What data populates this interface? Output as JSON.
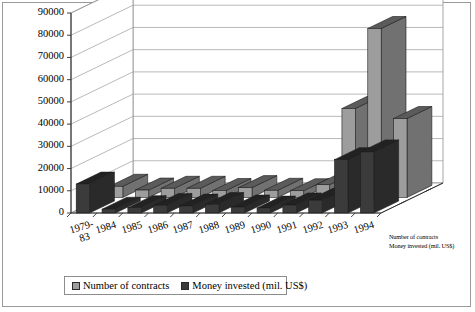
{
  "chart_data": {
    "type": "bar",
    "title": "",
    "subtitle": "",
    "xlabel": "",
    "ylabel": "",
    "projection": "3d-two-row",
    "grid": true,
    "legend_position": "bottom",
    "ylim": [
      0,
      90000
    ],
    "ytick_labels": [
      "0",
      "10000",
      "20000",
      "30000",
      "40000",
      "50000",
      "60000",
      "70000",
      "80000",
      "90000"
    ],
    "ytick_values": [
      0,
      10000,
      20000,
      30000,
      40000,
      50000,
      60000,
      70000,
      80000,
      90000
    ],
    "categories": [
      "1979-83",
      "1984",
      "1985",
      "1986",
      "1987",
      "1988",
      "1989",
      "1990",
      "1991",
      "1992",
      "1993",
      "1994"
    ],
    "category_lines": [
      [
        "1979-",
        "83"
      ],
      [
        "1984"
      ],
      [
        "1985"
      ],
      [
        "1986"
      ],
      [
        "1987"
      ],
      [
        "1988"
      ],
      [
        "1989"
      ],
      [
        "1990"
      ],
      [
        "1991"
      ],
      [
        "1992"
      ],
      [
        "1993"
      ],
      [
        "1994"
      ]
    ],
    "series": [
      {
        "name": "Number of contracts",
        "color": "#9d9d9d",
        "row": "back",
        "values": [
          5000,
          3300,
          4100,
          4100,
          3100,
          4400,
          3200,
          3000,
          5700,
          40000,
          76000,
          35500
        ]
      },
      {
        "name": "Money invested (mil. US$)",
        "color": "#3b3b3b",
        "row": "front",
        "values": [
          13000,
          1700,
          2400,
          3400,
          3100,
          3800,
          2700,
          2200,
          3600,
          5800,
          24000,
          27500
        ]
      }
    ]
  },
  "axis": {
    "z_labels": [
      "Number of contracts",
      "Money invested (mil. US$)"
    ]
  },
  "legend": {
    "entries": [
      {
        "label": "Number of contracts",
        "color": "#9d9d9d"
      },
      {
        "label": "Money invested (mil. US$)",
        "color": "#3b3b3b"
      }
    ]
  }
}
